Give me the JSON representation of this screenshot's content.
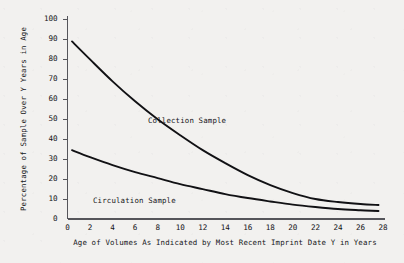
{
  "chart_data": {
    "type": "line",
    "title": "",
    "xlabel": "Age of Volumes As Indicated by Most Recent Imprint Date Y in Years",
    "ylabel": "Percentage of Sample Over Y Years in Age",
    "xlim": [
      0,
      28
    ],
    "ylim": [
      0,
      100
    ],
    "xticks": [
      "0",
      "2",
      "4",
      "6",
      "8",
      "10",
      "12",
      "14",
      "16",
      "18",
      "20",
      "22",
      "24",
      "26",
      "28"
    ],
    "yticks": [
      "0",
      "10",
      "20",
      "30",
      "40",
      "50",
      "60",
      "70",
      "80",
      "90",
      "100"
    ],
    "grid": false,
    "legend_position": "inline-annotation",
    "series": [
      {
        "name": "Collection Sample",
        "label_x": 11.2,
        "label_y": 52,
        "x": [
          0.4,
          2,
          4,
          6,
          8,
          10,
          12,
          14,
          16,
          18,
          20,
          22,
          24,
          26,
          27.6
        ],
        "y": [
          89,
          80,
          69,
          59,
          50,
          42,
          34.5,
          28,
          22,
          17,
          13,
          10,
          8.5,
          7.5,
          7
        ]
      },
      {
        "name": "Circulation Sample",
        "label_x": 3.4,
        "label_y": 11.5,
        "x": [
          0.4,
          2,
          4,
          6,
          8,
          10,
          12,
          14,
          16,
          18,
          20,
          22,
          24,
          26,
          27.6
        ],
        "y": [
          34.5,
          31,
          27,
          23.5,
          20.5,
          17.5,
          15,
          12.5,
          10.5,
          8.8,
          7.2,
          6,
          5,
          4.4,
          4
        ]
      }
    ]
  },
  "colors": {
    "background": "#f2f1ef",
    "ink": "#16161a",
    "axis": "#55555a",
    "curve": "#111114"
  }
}
